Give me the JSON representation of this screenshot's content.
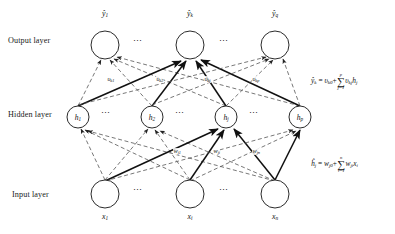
{
  "diagram": {
    "layers": [
      {
        "name": "output",
        "label": "Output layer",
        "label_x": 8,
        "label_y": 36,
        "y": 45,
        "node_r": 14,
        "nodes_x": [
          105,
          190,
          275
        ]
      },
      {
        "name": "hidden",
        "label": "Hidden layer",
        "label_x": 8,
        "label_y": 110,
        "y": 117,
        "node_r": 11,
        "nodes_x": [
          78,
          152,
          226,
          300
        ]
      },
      {
        "name": "input",
        "label": "Input layer",
        "label_x": 12,
        "label_y": 190,
        "y": 194,
        "node_r": 14,
        "nodes_x": [
          105,
          190,
          275
        ]
      }
    ],
    "output_labels": [
      {
        "text": "ŷ",
        "sub": "1",
        "x": 105,
        "y": 9
      },
      {
        "text": "ŷ",
        "sub": "k",
        "x": 190,
        "y": 9
      },
      {
        "text": "ŷ",
        "sub": "q",
        "x": 275,
        "y": 9
      }
    ],
    "hidden_labels": [
      {
        "text": "h",
        "sub": "1",
        "x": 78,
        "y": 113
      },
      {
        "text": "h",
        "sub": "2",
        "x": 152,
        "y": 113
      },
      {
        "text": "h",
        "sub": "j",
        "x": 226,
        "y": 113
      },
      {
        "text": "h",
        "sub": "p",
        "x": 300,
        "y": 113
      }
    ],
    "input_labels": [
      {
        "text": "x",
        "sub": "1",
        "x": 105,
        "y": 212
      },
      {
        "text": "x",
        "sub": "i",
        "x": 190,
        "y": 212
      },
      {
        "text": "x",
        "sub": "n",
        "x": 275,
        "y": 212
      }
    ],
    "v_weight_labels": [
      {
        "text": "υ",
        "sub": "k1",
        "x": 107,
        "y": 76
      },
      {
        "text": "υ",
        "sub": "k2",
        "x": 156,
        "y": 76
      },
      {
        "text": "υ",
        "sub": "kj",
        "x": 204,
        "y": 76
      },
      {
        "text": "υ",
        "sub": "kp",
        "x": 252,
        "y": 76
      }
    ],
    "w_weight_labels": [
      {
        "text": "w",
        "sub": "j1",
        "x": 173,
        "y": 148
      },
      {
        "text": "w",
        "sub": "ji",
        "x": 213,
        "y": 148
      },
      {
        "text": "w",
        "sub": "jn",
        "x": 252,
        "y": 148
      }
    ],
    "ellipses": [
      {
        "name": "output-ellipsis-left",
        "x": 140,
        "y": 41
      },
      {
        "name": "output-ellipsis-right",
        "x": 226,
        "y": 41
      },
      {
        "name": "hidden-ellipsis-1",
        "x": 108,
        "y": 113
      },
      {
        "name": "hidden-ellipsis-2",
        "x": 182,
        "y": 113
      },
      {
        "name": "hidden-ellipsis-3",
        "x": 256,
        "y": 113
      },
      {
        "name": "input-ellipsis-left",
        "x": 140,
        "y": 190
      },
      {
        "name": "input-ellipsis-right",
        "x": 226,
        "y": 190
      }
    ],
    "equations": [
      {
        "name": "output-equation",
        "x": 311,
        "y": 72,
        "lhs_var": "ŷ",
        "lhs_sub": "k",
        "eq": "=",
        "bias_var": "υ",
        "bias_sub": "k0",
        "plus": "+",
        "sum_top": "p",
        "sum_sym": "∑",
        "sum_bottom": "j=1",
        "term_var": "υ",
        "term_sub": "kj",
        "term2_var": "h",
        "term2_sub": "j"
      },
      {
        "name": "hidden-equation",
        "x": 311,
        "y": 155,
        "lhs_var": "ĥ",
        "lhs_sub": "j",
        "eq": "=",
        "bias_var": "w",
        "bias_sub": "j0",
        "plus": "+",
        "sum_top": "n",
        "sum_sym": "∑",
        "sum_bottom": "i=1",
        "term_var": "w",
        "term_sub": "ji",
        "term2_var": "x",
        "term2_sub": "i"
      }
    ],
    "colors": {
      "node_stroke": "#2b2b2b",
      "solid_edge": "#111111",
      "dashed_edge": "#555555",
      "background": "#ffffff",
      "text": "#1a1a1a"
    }
  }
}
